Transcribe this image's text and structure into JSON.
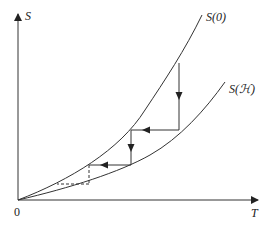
{
  "diagram": {
    "type": "curve-iteration-diagram",
    "axes": {
      "x_label": "T",
      "y_label": "S",
      "origin_label": "0"
    },
    "curves": [
      {
        "id": "upper",
        "label": "S(0)"
      },
      {
        "id": "lower",
        "label": "S(ℋ)"
      }
    ],
    "steps": [
      {
        "kind": "vertical-arrow",
        "from": "S(0)",
        "to": "S(ℋ)",
        "style": "solid"
      },
      {
        "kind": "horizontal-arrow",
        "from": "S(ℋ)",
        "to": "S(0)",
        "style": "solid"
      },
      {
        "kind": "vertical-arrow",
        "from": "S(0)",
        "to": "S(ℋ)",
        "style": "solid"
      },
      {
        "kind": "horizontal-arrow",
        "from": "S(ℋ)",
        "to": "S(0)",
        "style": "solid"
      },
      {
        "kind": "vertical-line",
        "from": "S(0)",
        "to": "S(ℋ)",
        "style": "dashed"
      },
      {
        "kind": "horizontal-line",
        "from": "S(ℋ)",
        "to": "S(0)",
        "style": "dashed"
      }
    ],
    "colors": {
      "stroke": "#333333",
      "background": "#ffffff"
    }
  }
}
